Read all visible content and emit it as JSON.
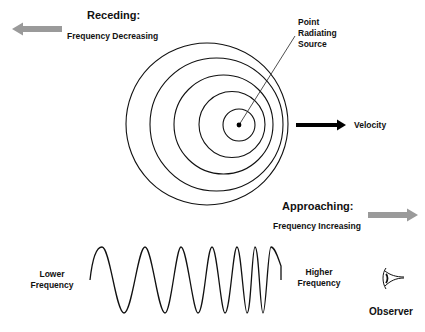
{
  "receding": {
    "title": "Receding:",
    "subtitle": "Frequency Decreasing",
    "arrow_color": "#9a9a9a"
  },
  "approaching": {
    "title": "Approaching:",
    "subtitle": "Frequency Increasing",
    "arrow_color": "#9a9a9a"
  },
  "source": {
    "line1": "Point",
    "line2": "Radiating",
    "line3": "Source"
  },
  "velocity": {
    "label": "Velocity"
  },
  "wave": {
    "lower_line1": "Lower",
    "lower_line2": "Frequency",
    "higher_line1": "Higher",
    "higher_line2": "Frequency"
  },
  "observer": {
    "label": "Observer",
    "icon": "eye-icon"
  },
  "wavefronts": [
    {
      "cx": 207,
      "cy": 124,
      "r": 81
    },
    {
      "cx": 216.5,
      "cy": 124.5,
      "r": 66.5
    },
    {
      "cx": 223.5,
      "cy": 124.5,
      "r": 49.5
    },
    {
      "cx": 232,
      "cy": 124.5,
      "r": 33
    },
    {
      "cx": 239,
      "cy": 125,
      "r": 16
    }
  ]
}
